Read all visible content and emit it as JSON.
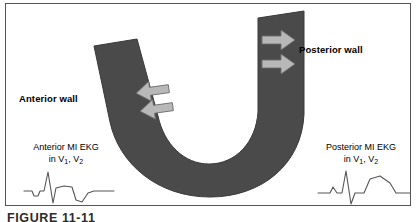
{
  "figure": {
    "caption": "FIGURE 11-11",
    "background_color": "#ffffff",
    "frame_color": "#555555"
  },
  "diagram": {
    "type": "myocardial-wall-schematic",
    "band_color": "#4a4a4a",
    "band_outline_color": "#3a3a3a",
    "arrow_fill_color": "#b8b8b8",
    "arrow_outline_color": "#6e6e6e",
    "shape": "u-shaped-ventricular-wall-band",
    "labels": {
      "anterior_wall": "Anterior wall",
      "posterior_wall": "Posterior wall"
    },
    "arrows": {
      "anterior_direction": "left",
      "anterior_count": 2,
      "posterior_direction": "right",
      "posterior_count": 2
    }
  },
  "ekg_panels": [
    {
      "id": "anterior",
      "line1": "Anterior MI EKG",
      "line2_prefix": "in V",
      "lead1": "1",
      "line2_sep": ", V",
      "lead2": "2",
      "trace_description": "small q, tall R, inverted T wave",
      "trace_color": "#555555"
    },
    {
      "id": "posterior",
      "line1": "Posterior MI EKG",
      "line2_prefix": "in V",
      "lead1": "1",
      "line2_sep": ", V",
      "lead2": "2",
      "trace_description": "tall R, deep S, large upright T wave",
      "trace_color": "#555555"
    }
  ]
}
